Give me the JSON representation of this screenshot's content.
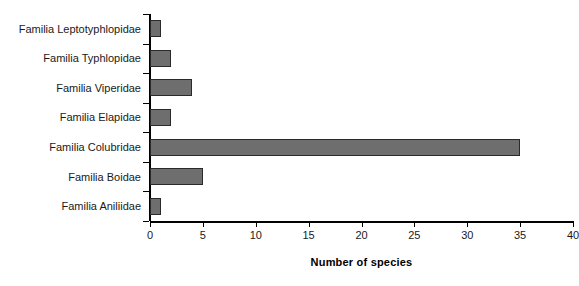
{
  "chart_data": {
    "type": "bar",
    "orientation": "horizontal",
    "title": "",
    "xlabel": "Number of species",
    "ylabel": "",
    "categories": [
      "Familia Leptotyphlopidae",
      "Familia Typhlopidae",
      "Familia Viperidae",
      "Familia Elapidae",
      "Familia Colubridae",
      "Familia Boidae",
      "Familia Aniliidae"
    ],
    "values": [
      1,
      2,
      4,
      2,
      35,
      5,
      1
    ],
    "xlim": [
      0,
      40
    ],
    "xticks": [
      0,
      5,
      10,
      15,
      20,
      25,
      30,
      35,
      40
    ],
    "xtick_labels": [
      "0",
      "5",
      "10",
      "15",
      "20",
      "25",
      "30",
      "35",
      "40"
    ],
    "grid": false,
    "legend": false,
    "bar_color": "#6e6e6e",
    "bar_border_color": "#2a2a2a",
    "axis_color": "#000000",
    "background": "#ffffff"
  }
}
